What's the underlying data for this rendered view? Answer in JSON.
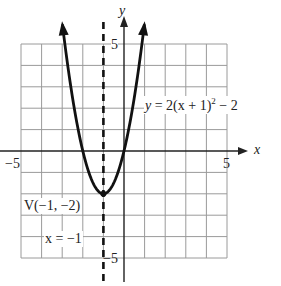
{
  "chart_data": {
    "type": "line",
    "title": "",
    "function": "y = 2(x + 1)^2 - 2",
    "xlabel": "x",
    "ylabel": "y",
    "xlim": [
      -5,
      5
    ],
    "ylim": [
      -5,
      5
    ],
    "grid": true,
    "grid_step": 1,
    "tick_labels": {
      "x": [
        "-5",
        "5"
      ],
      "y": [
        "5",
        "-5"
      ]
    },
    "series": [
      {
        "name": "parabola",
        "equation": "y = 2(x + 1)^2 - 2",
        "x": [
          -2.99,
          -2.5,
          -2,
          -1.5,
          -1,
          -0.5,
          0,
          0.5,
          0.99
        ],
        "y": [
          5.9,
          2.5,
          0,
          -1.5,
          -2,
          -1.5,
          0,
          2.5,
          5.9
        ]
      }
    ],
    "annotations": [
      {
        "text": "V(−1, −2)",
        "x": -1,
        "y": -2,
        "type": "vertex"
      },
      {
        "text": "x = −1",
        "type": "axis_of_symmetry",
        "style": "dashed"
      },
      {
        "text": "y = 2(x + 1)² − 2",
        "type": "equation_label"
      }
    ]
  },
  "labels": {
    "y_axis": "y",
    "x_axis": "x",
    "tick_y_top": "5",
    "tick_y_bottom": "−5",
    "tick_x_left": "−5",
    "tick_x_right": "5",
    "vertex": "V(−1, −2)",
    "symmetry": "x = −1",
    "eq_y": "y",
    "eq_rest": " = 2(x + 1)",
    "eq_exp": "2",
    "eq_tail": " − 2"
  },
  "style": {
    "curve_color": "#111111",
    "grid_color": "#9a9a9a",
    "axis_color": "#222222"
  }
}
